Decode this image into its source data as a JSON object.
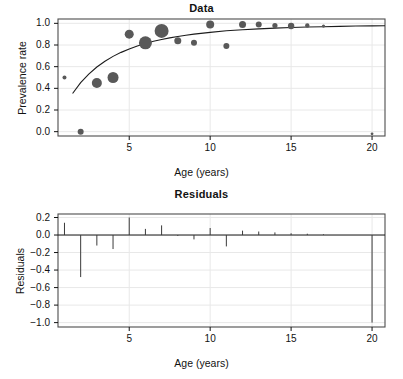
{
  "figure": {
    "background": "#ffffff",
    "foreground": "#121212",
    "point_color": "#595959",
    "curve_color": "#1c1c1c",
    "frame_color": "#4d4d4d",
    "grid_color": "#e8e8e8"
  },
  "panels": {
    "data": {
      "title": "Data",
      "xlabel": "Age (years)",
      "ylabel": "Prevalence rate",
      "xticks": [
        5,
        10,
        15,
        20
      ],
      "xtick_labels": [
        "5",
        "10",
        "15",
        "20"
      ],
      "yticks": [
        0.0,
        0.2,
        0.4,
        0.6,
        0.8,
        1.0
      ],
      "ytick_labels": [
        "0.0",
        "0.2",
        "0.4",
        "0.6",
        "0.8",
        "1.0"
      ]
    },
    "residuals": {
      "title": "Residuals",
      "xlabel": "Age (years)",
      "ylabel": "Residuals",
      "xticks": [
        5,
        10,
        15,
        20
      ],
      "xtick_labels": [
        "5",
        "10",
        "15",
        "20"
      ],
      "yticks": [
        0.2,
        0.0,
        -0.2,
        -0.4,
        -0.6,
        -0.8,
        -1.0
      ],
      "ytick_labels": [
        "0.2",
        "0.0",
        "−0.2",
        "−0.4",
        "−0.6",
        "−0.8",
        "−1.0"
      ]
    }
  },
  "chart_data": [
    {
      "type": "scatter",
      "title": "Data",
      "xlabel": "Age (years)",
      "ylabel": "Prevalence rate",
      "xlim": [
        0.6,
        20.8
      ],
      "ylim": [
        -0.04,
        1.04
      ],
      "grid": true,
      "legend": "none",
      "note": "Bubble scatter; marker area encodes sample size. Solid line is the fitted prevalence curve.",
      "points": [
        {
          "x": 1,
          "y": 0.5,
          "size": 2.0
        },
        {
          "x": 2,
          "y": 0.0,
          "size": 3.0
        },
        {
          "x": 3,
          "y": 0.45,
          "size": 5.0
        },
        {
          "x": 4,
          "y": 0.5,
          "size": 5.5
        },
        {
          "x": 5,
          "y": 0.9,
          "size": 4.5
        },
        {
          "x": 6,
          "y": 0.82,
          "size": 6.5
        },
        {
          "x": 7,
          "y": 0.93,
          "size": 7.0
        },
        {
          "x": 8,
          "y": 0.84,
          "size": 3.5
        },
        {
          "x": 9,
          "y": 0.82,
          "size": 3.0
        },
        {
          "x": 10,
          "y": 0.99,
          "size": 4.0
        },
        {
          "x": 11,
          "y": 0.79,
          "size": 3.0
        },
        {
          "x": 12,
          "y": 0.99,
          "size": 3.5
        },
        {
          "x": 13,
          "y": 0.99,
          "size": 3.0
        },
        {
          "x": 14,
          "y": 0.98,
          "size": 2.6
        },
        {
          "x": 15,
          "y": 0.975,
          "size": 3.2
        },
        {
          "x": 16,
          "y": 0.98,
          "size": 2.2
        },
        {
          "x": 17,
          "y": 0.975,
          "size": 1.6
        },
        {
          "x": 20,
          "y": -0.02,
          "size": 1.4
        }
      ],
      "fitted_curve": {
        "name": "fitted prevalence",
        "x": [
          1.5,
          2,
          2.5,
          3,
          3.5,
          4,
          4.5,
          5,
          5.5,
          6,
          6.5,
          7,
          7.5,
          8,
          8.5,
          9,
          10,
          11,
          12,
          13,
          14,
          15,
          16,
          17,
          18,
          19,
          20,
          20.8
        ],
        "y": [
          0.352,
          0.452,
          0.532,
          0.597,
          0.65,
          0.695,
          0.732,
          0.764,
          0.791,
          0.814,
          0.834,
          0.851,
          0.866,
          0.879,
          0.89,
          0.9,
          0.917,
          0.931,
          0.941,
          0.949,
          0.956,
          0.961,
          0.966,
          0.969,
          0.972,
          0.975,
          0.977,
          0.978
        ]
      }
    },
    {
      "type": "bar",
      "title": "Residuals",
      "xlabel": "Age (years)",
      "ylabel": "Residuals",
      "xlim": [
        0.6,
        20.8
      ],
      "ylim": [
        -1.05,
        0.24
      ],
      "grid": true,
      "legend": "none",
      "note": "Vertical stick plot of residuals about the zero reference line.",
      "categories": [
        1,
        2,
        3,
        4,
        5,
        6,
        7,
        8,
        9,
        10,
        11,
        12,
        13,
        14,
        15,
        16,
        17,
        20
      ],
      "values": [
        0.14,
        -0.48,
        -0.12,
        -0.16,
        0.2,
        0.07,
        0.11,
        -0.01,
        -0.05,
        0.08,
        -0.13,
        0.05,
        0.04,
        0.03,
        0.02,
        0.015,
        0.008,
        -1.0
      ]
    }
  ]
}
